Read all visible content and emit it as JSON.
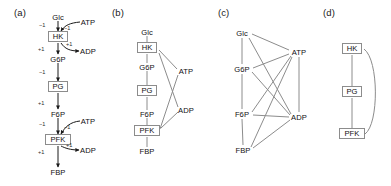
{
  "figure": {
    "background": "#ffffff",
    "width": 391,
    "height": 186,
    "line_color": "#8c8c8c",
    "arrow_color": "#1a1a1a",
    "text_color": "#111111"
  },
  "panels": [
    {
      "id": "a",
      "label": "(a)",
      "caption_x": 14,
      "caption_y": 14,
      "type": "stoichiometric-reaction-diagram",
      "metabolites": [
        {
          "name": "Glc",
          "x": 58,
          "y": 17
        },
        {
          "name": "G6P",
          "x": 58,
          "y": 59
        },
        {
          "name": "F6P",
          "x": 58,
          "y": 114
        },
        {
          "name": "FBP",
          "x": 58,
          "y": 172
        },
        {
          "name": "ATP",
          "x": 88,
          "y": 22
        },
        {
          "name": "ADP",
          "x": 88,
          "y": 51
        },
        {
          "name": "ATP",
          "x": 88,
          "y": 121
        },
        {
          "name": "ADP",
          "x": 88,
          "y": 150
        }
      ],
      "reactions": [
        {
          "name": "HK",
          "x": 58,
          "y": 37
        },
        {
          "name": "PG",
          "x": 58,
          "y": 87
        },
        {
          "name": "PFK",
          "x": 58,
          "y": 140
        }
      ],
      "coefficients": [
        {
          "value": "−1",
          "x": 45,
          "y": 26,
          "edge": "Glc-to-HK"
        },
        {
          "value": "−1",
          "x": 68,
          "y": 28,
          "edge": "ATP-to-HK"
        },
        {
          "value": "+1",
          "x": 44,
          "y": 50,
          "edge": "HK-to-G6P"
        },
        {
          "value": "+1",
          "x": 70,
          "y": 44,
          "edge": "HK-to-ADP"
        },
        {
          "value": "−1",
          "x": 45,
          "y": 73,
          "edge": "G6P-to-PG"
        },
        {
          "value": "+1",
          "x": 44,
          "y": 104,
          "edge": "PG-to-F6P"
        },
        {
          "value": "−1",
          "x": 45,
          "y": 125,
          "edge": "F6P-to-PFK"
        },
        {
          "value": "−1",
          "x": 68,
          "y": 127,
          "edge": "ATP-to-PFK"
        },
        {
          "value": "+1",
          "x": 44,
          "y": 153,
          "edge": "PFK-to-FBP"
        },
        {
          "value": "+1",
          "x": 70,
          "y": 146,
          "edge": "PFK-to-ADP"
        }
      ]
    },
    {
      "id": "b",
      "label": "(b)",
      "caption_x": 112,
      "caption_y": 14,
      "type": "bipartite-graph",
      "metabolites": [
        {
          "name": "Glc",
          "x": 147,
          "y": 32
        },
        {
          "name": "G6P",
          "x": 147,
          "y": 67
        },
        {
          "name": "F6P",
          "x": 147,
          "y": 114
        },
        {
          "name": "FBP",
          "x": 147,
          "y": 151
        },
        {
          "name": "ATP",
          "x": 186,
          "y": 71
        },
        {
          "name": "ADP",
          "x": 186,
          "y": 110
        }
      ],
      "reactions": [
        {
          "name": "HK",
          "x": 147,
          "y": 48
        },
        {
          "name": "PG",
          "x": 147,
          "y": 91
        },
        {
          "name": "PFK",
          "x": 147,
          "y": 131
        }
      ],
      "edges": [
        [
          "Glc",
          "HK"
        ],
        [
          "HK",
          "G6P"
        ],
        [
          "G6P",
          "PG"
        ],
        [
          "PG",
          "F6P"
        ],
        [
          "F6P",
          "PFK"
        ],
        [
          "PFK",
          "FBP"
        ],
        [
          "HK",
          "ATP"
        ],
        [
          "HK",
          "ADP"
        ],
        [
          "PFK",
          "ATP"
        ],
        [
          "PFK",
          "ADP"
        ]
      ]
    },
    {
      "id": "c",
      "label": "(c)",
      "caption_x": 218,
      "caption_y": 14,
      "type": "metabolite-projection-graph",
      "metabolites": [
        {
          "name": "Glc",
          "x": 242,
          "y": 33
        },
        {
          "name": "G6P",
          "x": 242,
          "y": 69
        },
        {
          "name": "F6P",
          "x": 242,
          "y": 114
        },
        {
          "name": "FBP",
          "x": 243,
          "y": 150
        },
        {
          "name": "ATP",
          "x": 299,
          "y": 52
        },
        {
          "name": "ADP",
          "x": 299,
          "y": 117
        }
      ],
      "edges": [
        [
          "Glc",
          "G6P"
        ],
        [
          "Glc",
          "ATP"
        ],
        [
          "Glc",
          "ADP"
        ],
        [
          "G6P",
          "ATP"
        ],
        [
          "G6P",
          "ADP"
        ],
        [
          "G6P",
          "F6P"
        ],
        [
          "F6P",
          "ATP"
        ],
        [
          "F6P",
          "ADP"
        ],
        [
          "F6P",
          "FBP"
        ],
        [
          "FBP",
          "ATP"
        ],
        [
          "FBP",
          "ADP"
        ],
        [
          "ATP",
          "ADP"
        ]
      ]
    },
    {
      "id": "d",
      "label": "(d)",
      "caption_x": 323,
      "caption_y": 14,
      "type": "reaction-projection-graph",
      "reactions": [
        {
          "name": "HK",
          "x": 352,
          "y": 49
        },
        {
          "name": "PG",
          "x": 352,
          "y": 92
        },
        {
          "name": "PFK",
          "x": 352,
          "y": 134
        }
      ],
      "edges": [
        [
          "HK",
          "PG"
        ],
        [
          "PG",
          "PFK"
        ]
      ],
      "curved_edges": [
        [
          "HK",
          "PFK"
        ]
      ]
    }
  ]
}
